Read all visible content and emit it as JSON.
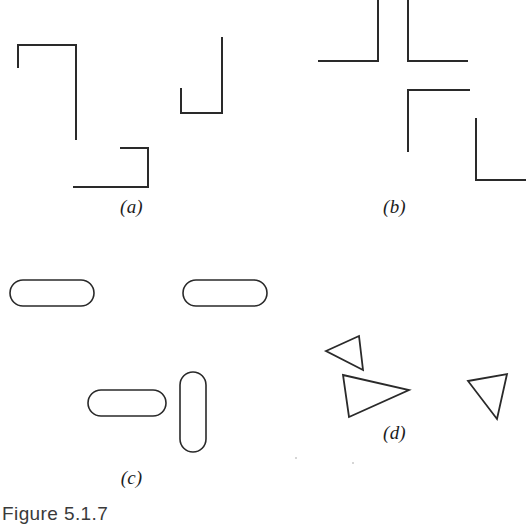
{
  "figure": {
    "caption": "Figure 5.1.7",
    "background_color": "#ffffff",
    "ink_color": "#2a2a2a",
    "width": 526,
    "height": 528
  },
  "panels": [
    {
      "id": "a",
      "label": "(a)",
      "description": "Open angular line figures: two corner brackets and one J-shaped bracket",
      "elements": [
        {
          "name": "bracket-top-left",
          "type": "polyline",
          "points": "18,68 18,45 76,45 76,140"
        },
        {
          "name": "bracket-j-right",
          "type": "polyline",
          "points": "181,88 181,113 222,113 222,37"
        },
        {
          "name": "bracket-bottom-center",
          "type": "polyline",
          "points": "120,148 148,148 148,187 73,187"
        }
      ]
    },
    {
      "id": "b",
      "label": "(b)",
      "description": "Four right-angle corner brackets arranged around a central cross gap",
      "elements": [
        {
          "name": "corner-upper-left",
          "type": "polyline",
          "points": "55,61 115,61 115,0"
        },
        {
          "name": "corner-upper-right",
          "type": "polyline",
          "points": "145,0 145,61 205,61"
        },
        {
          "name": "corner-lower-left",
          "type": "polyline",
          "points": "145,152 145,90 207,90"
        },
        {
          "name": "corner-lower-right",
          "type": "polyline",
          "points": "213,118 213,180 263,180"
        }
      ]
    },
    {
      "id": "c",
      "label": "(c)",
      "description": "Four rounded stadium (pill) outlines, three horizontal and one vertical",
      "elements": [
        {
          "name": "pill-top-left",
          "type": "stadium",
          "x": 10,
          "y": 18,
          "w": 84,
          "h": 26,
          "orientation": "horizontal"
        },
        {
          "name": "pill-top-right",
          "type": "stadium",
          "x": 183,
          "y": 18,
          "w": 84,
          "h": 26,
          "orientation": "horizontal"
        },
        {
          "name": "pill-bottom-center",
          "type": "stadium",
          "x": 88,
          "y": 128,
          "w": 78,
          "h": 26,
          "orientation": "horizontal"
        },
        {
          "name": "pill-vertical",
          "type": "stadium",
          "x": 180,
          "y": 110,
          "w": 26,
          "h": 80,
          "orientation": "vertical"
        }
      ]
    },
    {
      "id": "d",
      "label": "(d)",
      "description": "Three small outlined triangles in differing orientations",
      "elements": [
        {
          "name": "triangle-left-pointing-upper",
          "type": "triangle",
          "points": "63,89 96,74 100,108",
          "points_to": "left"
        },
        {
          "name": "triangle-right-pointing-middle",
          "type": "triangle",
          "points": "80,113 146,128 86,155",
          "points_to": "right"
        },
        {
          "name": "triangle-left-pointing-right",
          "type": "triangle",
          "points": "205,119 244,112 234,157",
          "points_to": "left"
        }
      ]
    }
  ]
}
